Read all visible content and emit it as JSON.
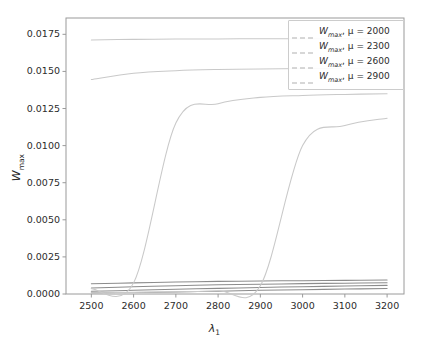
{
  "chart_data": {
    "type": "line",
    "title": "",
    "xlabel": "λ₁",
    "xlabel_base": "λ",
    "xlabel_sub": "1",
    "ylabel": "W_max",
    "ylabel_base": "W",
    "ylabel_sub": "max",
    "xlim": [
      2440,
      3240
    ],
    "ylim": [
      0.0,
      0.0186
    ],
    "xticks": [
      2500,
      2600,
      2700,
      2800,
      2900,
      3000,
      3100,
      3200
    ],
    "xtick_labels": [
      "2500",
      "2600",
      "2700",
      "2800",
      "2900",
      "3000",
      "3100",
      "3200"
    ],
    "yticks": [
      0.0,
      0.0025,
      0.005,
      0.0075,
      0.01,
      0.0125,
      0.015,
      0.0175
    ],
    "ytick_labels": [
      "0.0000",
      "0.0025",
      "0.0050",
      "0.0075",
      "0.0100",
      "0.0125",
      "0.0150",
      "0.0175"
    ],
    "grid": false,
    "legend_position": "upper right",
    "x": [
      2500,
      2600,
      2700,
      2800,
      2900,
      3000,
      3100,
      3200
    ],
    "series": [
      {
        "name": "W_max, μ = 2000",
        "legend_label": "W_max, μ = 2000",
        "mu": 2000,
        "color": "#8c8c8c",
        "style": "solid",
        "values": [
          0.00069,
          0.00075,
          0.00081,
          0.00085,
          0.00088,
          0.0009,
          0.00092,
          0.00094
        ]
      },
      {
        "name": "W_max, μ = 2300",
        "legend_label": "W_max, μ = 2300",
        "mu": 2300,
        "color": "#8c8c8c",
        "style": "solid",
        "values": [
          0.0004,
          0.00049,
          0.00056,
          0.00062,
          0.00066,
          0.0007,
          0.00073,
          0.00076
        ]
      },
      {
        "name": "W_max, μ = 2600",
        "legend_label": "W_max, μ = 2600",
        "mu": 2600,
        "color": "#8c8c8c",
        "style": "solid",
        "values": [
          0.00018,
          0.00025,
          0.00032,
          0.00038,
          0.00044,
          0.00049,
          0.00054,
          0.00058
        ]
      },
      {
        "name": "W_max, μ = 2900",
        "legend_label": "W_max, μ = 2900",
        "mu": 2900,
        "color": "#8c8c8c",
        "style": "solid",
        "values": [
          8.5e-05,
          0.000105,
          0.00014,
          0.00019,
          0.00025,
          0.00029,
          0.00033,
          0.00037
        ]
      },
      {
        "name": "W_max upper, μ = 2000",
        "legend_label": "W_max, μ = 2000",
        "mu": 2000,
        "color": "#c9c9c9",
        "style": "solid",
        "values": [
          0.01712,
          0.01716,
          0.01718,
          0.01719,
          0.0172,
          0.0172,
          0.01721,
          0.01721
        ]
      },
      {
        "name": "W_max upper, μ = 2300",
        "legend_label": "W_max, μ = 2300",
        "mu": 2300,
        "color": "#c9c9c9",
        "style": "solid",
        "values": [
          0.01445,
          0.01488,
          0.01505,
          0.01513,
          0.01517,
          0.01519,
          0.01521,
          0.01522
        ]
      },
      {
        "name": "W_max upper, μ = 2600",
        "legend_label": "W_max, μ = 2600",
        "mu": 2600,
        "color": "#c9c9c9",
        "style": "solid",
        "values": [
          0.00036,
          0.00075,
          0.01152,
          0.01282,
          0.01325,
          0.01338,
          0.01345,
          0.0135
        ]
      },
      {
        "name": "W_max upper, μ = 2900",
        "legend_label": "W_max, μ = 2900",
        "mu": 2900,
        "color": "#c9c9c9",
        "style": "solid",
        "values": [
          8.5e-05,
          0.00011,
          0.00015,
          0.00022,
          0.00055,
          0.01,
          0.01135,
          0.01185
        ]
      }
    ],
    "legend_entries": [
      {
        "label_base": "W",
        "label_sub": "max",
        "mu_text": ", μ = 2000",
        "color": "#b0b0b0",
        "style": "dashed"
      },
      {
        "label_base": "W",
        "label_sub": "max",
        "mu_text": ", μ = 2300",
        "color": "#b0b0b0",
        "style": "dashed"
      },
      {
        "label_base": "W",
        "label_sub": "max",
        "mu_text": ", μ = 2600",
        "color": "#b0b0b0",
        "style": "dashed"
      },
      {
        "label_base": "W",
        "label_sub": "max",
        "mu_text": ", μ = 2900",
        "color": "#b0b0b0",
        "style": "dashed"
      }
    ],
    "axis_color": "#9a9a9a",
    "text_color": "#2b2b2b",
    "background": "#ffffff"
  }
}
